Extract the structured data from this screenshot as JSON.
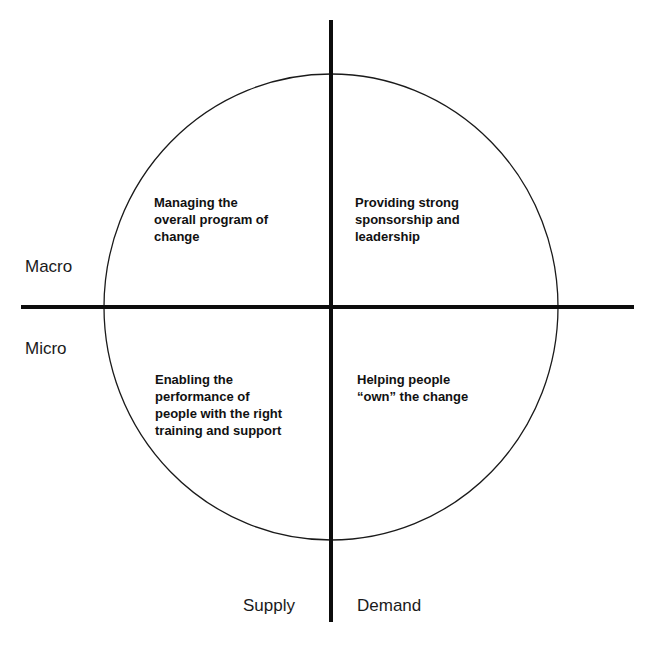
{
  "diagram": {
    "type": "quadrant",
    "colors": {
      "axis": "#0d0d0d",
      "circle": "#1a1a1a",
      "text": "#111111",
      "background": "#ffffff"
    },
    "axes": {
      "vertical": {
        "top_label": "",
        "bottom_left_label": "Supply",
        "bottom_right_label": "Demand"
      },
      "horizontal": {
        "upper_label": "Macro",
        "lower_label": "Micro"
      }
    },
    "quadrants": {
      "top_left": {
        "lines": [
          "Managing the",
          "overall program of",
          "change"
        ]
      },
      "top_right": {
        "lines": [
          "Providing strong",
          "sponsorship and",
          "leadership"
        ]
      },
      "bottom_left": {
        "lines": [
          "Enabling the",
          "performance of",
          "people with the right",
          "training and support"
        ]
      },
      "bottom_right": {
        "lines": [
          "Helping people",
          "“own” the change"
        ]
      }
    }
  }
}
